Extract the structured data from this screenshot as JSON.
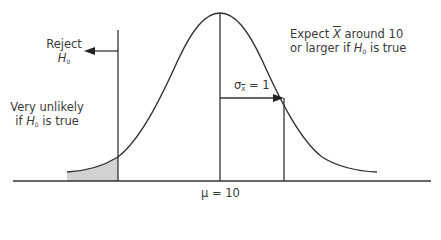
{
  "diagram": {
    "type": "normal-distribution-hypothesis-test",
    "labels": {
      "reject": {
        "line1": "Reject",
        "h": "H",
        "h_sub": "0"
      },
      "very_unlikely": {
        "line1": "Very unlikely",
        "line2_pre": "if ",
        "h": "H",
        "h_sub": "0",
        "line2_post": " is true"
      },
      "expect": {
        "pre": "Expect ",
        "xbar": "X",
        "post": " around 10",
        "line2_pre": "or larger if ",
        "h": "H",
        "h_sub": "0",
        "line2_post": " is true"
      },
      "sigma": {
        "sym": "σ",
        "sub": "X",
        "eq": " = 1"
      },
      "mu": {
        "text": "μ = 10"
      }
    },
    "colors": {
      "stroke": "#333333",
      "shade": "#d2d2d2",
      "text": "#3a3a3a"
    }
  }
}
